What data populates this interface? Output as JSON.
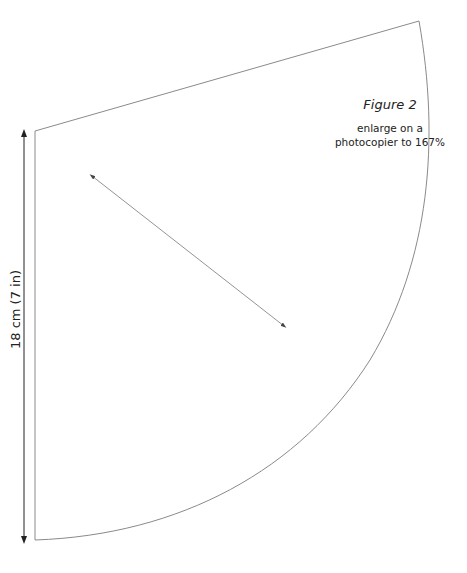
{
  "figure": {
    "title": "Figure 2",
    "note_line1": "enlarge on a",
    "note_line2": "photocopier to 167%"
  },
  "dimension": {
    "label": "18 cm (7 in)"
  },
  "colors": {
    "outline": "#8a8a8a",
    "arrow": "#222222",
    "background": "#ffffff"
  }
}
